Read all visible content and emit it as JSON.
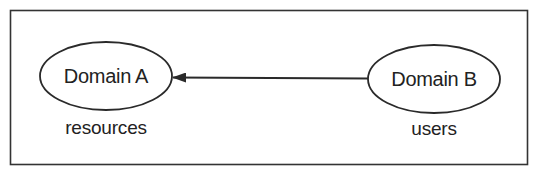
{
  "diagram": {
    "colors": {
      "stroke": "#2a2a2a",
      "text": "#222222",
      "background": "#ffffff"
    },
    "nodes": [
      {
        "id": "domain-a",
        "label": "Domain A",
        "caption": "resources"
      },
      {
        "id": "domain-b",
        "label": "Domain B",
        "caption": "users"
      }
    ],
    "edges": [
      {
        "from": "domain-b",
        "to": "domain-a",
        "type": "arrow"
      }
    ]
  }
}
